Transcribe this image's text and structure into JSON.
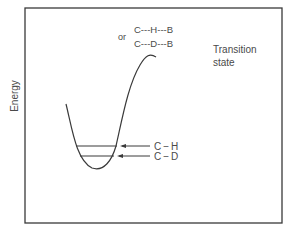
{
  "figure": {
    "axis_label": "Energy",
    "transition_state": {
      "label_line1": "Transition",
      "label_line2": "state",
      "connector": "or",
      "structure_h": "C---H---B",
      "structure_d": "C---D---B"
    },
    "levels": [
      {
        "label": "C − H",
        "label_left": "C",
        "label_dash": "−",
        "label_right": "H"
      },
      {
        "label": "C − D",
        "label_left": "C",
        "label_dash": "−",
        "label_right": "D"
      }
    ],
    "colors": {
      "line": "#3a3a3a",
      "text": "#4a4a4a",
      "background": "#ffffff"
    }
  }
}
